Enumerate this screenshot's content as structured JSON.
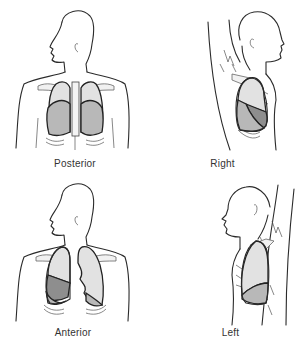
{
  "figure": {
    "panels": [
      {
        "id": "posterior",
        "label": "Posterior",
        "view": "back",
        "lobes_shown": [
          "upper (light)",
          "lower (mid-gray)"
        ]
      },
      {
        "id": "right",
        "label": "Right",
        "view": "right lateral",
        "lobes_shown": [
          "upper (light)",
          "middle (dark gray)",
          "lower (mid-gray)"
        ]
      },
      {
        "id": "anterior",
        "label": "Anterior",
        "view": "front",
        "lobes_shown": [
          "right upper (light)",
          "right middle (dark gray)",
          "right lower (mid-gray)",
          "left upper (light)",
          "left lower (mid-gray)"
        ]
      },
      {
        "id": "left",
        "label": "Left",
        "view": "left lateral",
        "lobes_shown": [
          "upper (light)",
          "lower (mid-gray)"
        ]
      }
    ],
    "colors": {
      "upper_lobe": "#e2e2e2",
      "lower_lobe": "#b8b8b8",
      "middle_lobe": "#8e8e8e",
      "outline": "#2b2b2b"
    }
  }
}
